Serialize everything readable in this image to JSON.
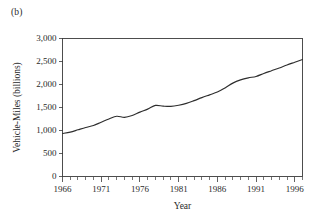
{
  "figure": {
    "panel_label": "(b)",
    "background": "#ffffff",
    "line_color": "#2e2e2e",
    "axis_color": "#3a3a3a"
  },
  "chart_data": {
    "type": "line",
    "title": "",
    "panel": "(b)",
    "xlabel": "Year",
    "ylabel": "Vehicle-Miles (billions)",
    "xlim": [
      1966,
      1997
    ],
    "ylim": [
      0,
      3000
    ],
    "grid": false,
    "legend": false,
    "y_ticks": [
      0,
      500,
      1000,
      1500,
      2000,
      2500,
      3000
    ],
    "y_tick_labels": [
      "0",
      "500",
      "1,000",
      "1,500",
      "2,000",
      "2,500",
      "3,000"
    ],
    "x_ticks_major": [
      1966,
      1971,
      1976,
      1981,
      1986,
      1991,
      1996
    ],
    "x_tick_labels": [
      "1966",
      "1971",
      "1976",
      "1981",
      "1986",
      "1991",
      "1996"
    ],
    "x_ticks_minor": [
      1967,
      1968,
      1969,
      1970,
      1972,
      1973,
      1974,
      1975,
      1977,
      1978,
      1979,
      1980,
      1982,
      1983,
      1984,
      1985,
      1987,
      1988,
      1989,
      1990,
      1992,
      1993,
      1994,
      1995,
      1997
    ],
    "x": [
      1966,
      1967,
      1968,
      1969,
      1970,
      1971,
      1972,
      1973,
      1974,
      1975,
      1976,
      1977,
      1978,
      1979,
      1980,
      1981,
      1982,
      1983,
      1984,
      1985,
      1986,
      1987,
      1988,
      1989,
      1990,
      1991,
      1992,
      1993,
      1994,
      1995,
      1996,
      1997
    ],
    "values": [
      935,
      965,
      1015,
      1065,
      1110,
      1180,
      1250,
      1310,
      1285,
      1325,
      1400,
      1465,
      1545,
      1530,
      1525,
      1550,
      1590,
      1650,
      1715,
      1775,
      1835,
      1925,
      2030,
      2100,
      2145,
      2175,
      2240,
      2300,
      2360,
      2425,
      2485,
      2545
    ],
    "series": [
      {
        "name": "Vehicle-Miles",
        "values": [
          935,
          965,
          1015,
          1065,
          1110,
          1180,
          1250,
          1310,
          1285,
          1325,
          1400,
          1465,
          1545,
          1530,
          1525,
          1550,
          1590,
          1650,
          1715,
          1775,
          1835,
          1925,
          2030,
          2100,
          2145,
          2175,
          2240,
          2300,
          2360,
          2425,
          2485,
          2545
        ]
      }
    ],
    "annotations": []
  }
}
